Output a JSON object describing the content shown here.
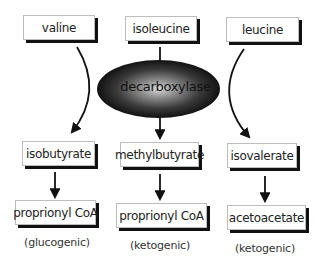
{
  "diagram": {
    "type": "metabolic-pathway",
    "enzyme": {
      "label": "decarboxylase"
    },
    "columns": [
      {
        "amino_acid": "valine",
        "intermediate": "isobutyrate",
        "product": "proprionyl CoA",
        "classification": "(glucogenic)"
      },
      {
        "amino_acid": "isoleucine",
        "intermediate": "methylbutyrate",
        "product": "proprionyl CoA",
        "classification": "(ketogenic)"
      },
      {
        "amino_acid": "leucine",
        "intermediate": "isovalerate",
        "product": "acetoacetate",
        "classification": "(ketogenic)"
      }
    ],
    "edges": [
      {
        "from": "valine",
        "to": "isobutyrate",
        "style": "curved-arrow"
      },
      {
        "from": "isoleucine",
        "to": "decarboxylase",
        "style": "line"
      },
      {
        "from": "decarboxylase",
        "to": "methylbutyrate",
        "style": "arrow"
      },
      {
        "from": "leucine",
        "to": "isovalerate",
        "style": "curved-arrow"
      },
      {
        "from": "isobutyrate",
        "to": "proprionyl CoA",
        "style": "arrow"
      },
      {
        "from": "methylbutyrate",
        "to": "proprionyl CoA",
        "style": "arrow"
      },
      {
        "from": "isovalerate",
        "to": "acetoacetate",
        "style": "arrow"
      }
    ],
    "colors": {
      "box_fill": "#ffffff",
      "box_shadow": "#111111",
      "arrow": "#111111",
      "enzyme_center": "#d8d8d8",
      "enzyme_edge": "#000000"
    }
  }
}
